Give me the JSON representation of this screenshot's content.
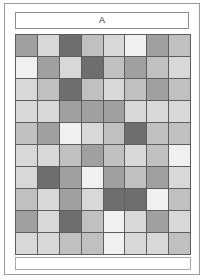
{
  "panel": {
    "header_label": "A",
    "border_color": "#9a9a9a",
    "background": "#ffffff"
  },
  "chart_data": {
    "type": "heatmap",
    "title": "A",
    "xlabel": "",
    "ylabel": "",
    "rows": 10,
    "columns": 8,
    "grid": true,
    "gridline_color": "#5d5d5d",
    "legend": "none",
    "colorscale": "grayscale",
    "value_range": [
      1,
      5
    ],
    "palette": {
      "1": "#f0f0f0",
      "2": "#d8d8d8",
      "3": "#c0c0c0",
      "4": "#a0a0a0",
      "5": "#6e6e6e"
    },
    "values": [
      [
        4,
        2,
        5,
        3,
        2,
        1,
        4,
        3
      ],
      [
        1,
        4,
        2,
        5,
        3,
        4,
        3,
        2
      ],
      [
        2,
        3,
        5,
        3,
        2,
        3,
        4,
        3
      ],
      [
        2,
        2,
        4,
        4,
        4,
        2,
        2,
        2
      ],
      [
        3,
        4,
        1,
        2,
        3,
        5,
        3,
        3
      ],
      [
        2,
        2,
        3,
        4,
        3,
        2,
        3,
        1
      ],
      [
        2,
        5,
        4,
        1,
        4,
        3,
        4,
        2
      ],
      [
        3,
        2,
        4,
        2,
        5,
        5,
        1,
        3
      ],
      [
        4,
        2,
        5,
        3,
        1,
        2,
        4,
        2
      ],
      [
        2,
        2,
        3,
        3,
        1,
        2,
        2,
        3
      ]
    ],
    "cells_flat": [
      "#a0a0a0",
      "#d8d8d8",
      "#6e6e6e",
      "#c0c0c0",
      "#d8d8d8",
      "#f0f0f0",
      "#a0a0a0",
      "#c0c0c0",
      "#f0f0f0",
      "#a0a0a0",
      "#d8d8d8",
      "#6e6e6e",
      "#c0c0c0",
      "#a0a0a0",
      "#c0c0c0",
      "#d8d8d8",
      "#d8d8d8",
      "#c0c0c0",
      "#6e6e6e",
      "#c0c0c0",
      "#d8d8d8",
      "#c0c0c0",
      "#a0a0a0",
      "#c0c0c0",
      "#d8d8d8",
      "#d8d8d8",
      "#a0a0a0",
      "#a0a0a0",
      "#a0a0a0",
      "#d8d8d8",
      "#d8d8d8",
      "#d8d8d8",
      "#c0c0c0",
      "#a0a0a0",
      "#f0f0f0",
      "#d8d8d8",
      "#c0c0c0",
      "#6e6e6e",
      "#c0c0c0",
      "#c0c0c0",
      "#d8d8d8",
      "#d8d8d8",
      "#c0c0c0",
      "#a0a0a0",
      "#c0c0c0",
      "#d8d8d8",
      "#c0c0c0",
      "#f0f0f0",
      "#d8d8d8",
      "#6e6e6e",
      "#a0a0a0",
      "#f0f0f0",
      "#a0a0a0",
      "#c0c0c0",
      "#a0a0a0",
      "#d8d8d8",
      "#c0c0c0",
      "#d8d8d8",
      "#a0a0a0",
      "#d8d8d8",
      "#6e6e6e",
      "#6e6e6e",
      "#f0f0f0",
      "#c0c0c0",
      "#a0a0a0",
      "#d8d8d8",
      "#6e6e6e",
      "#c0c0c0",
      "#f0f0f0",
      "#d8d8d8",
      "#a0a0a0",
      "#d8d8d8",
      "#d8d8d8",
      "#d8d8d8",
      "#c0c0c0",
      "#c0c0c0",
      "#f0f0f0",
      "#d8d8d8",
      "#d8d8d8",
      "#c0c0c0"
    ]
  }
}
